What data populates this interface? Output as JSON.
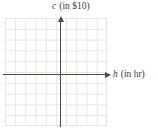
{
  "figure": {
    "y_axis_label": {
      "variable": "c",
      "unit": "(in $10)"
    },
    "x_axis_label": {
      "variable": "h",
      "unit": "(in hr)"
    }
  },
  "colors": {
    "background": "#ffffff",
    "grid_line": "#e8e6e1",
    "axis_line": "#4c4c4c",
    "label_text": "#3d3d3d"
  },
  "chart_data": {
    "type": "scatter",
    "title": "",
    "xlabel": "h (in hr)",
    "ylabel": "c (in $10)",
    "points": [],
    "grid": true,
    "legend": false,
    "x_axis_arrow": "right",
    "y_axis_arrow": "up"
  }
}
